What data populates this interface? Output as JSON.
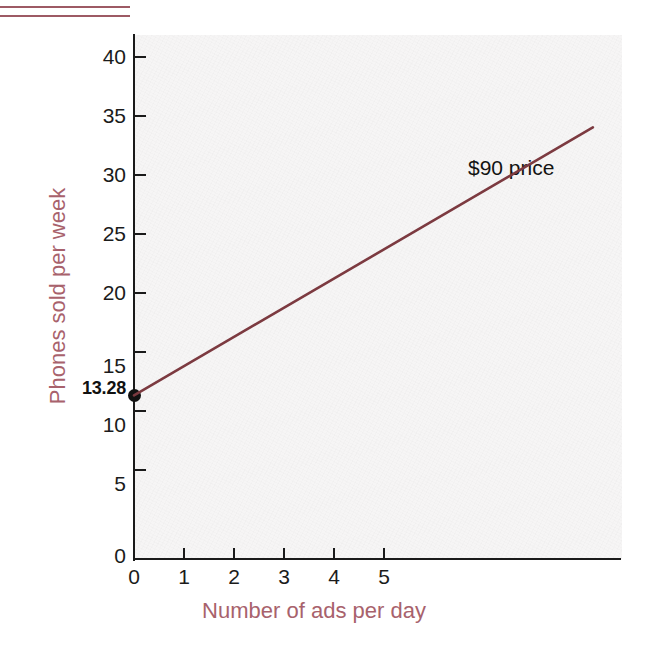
{
  "figure": {
    "background_color": "#ffffff",
    "plot_background_color": "#f6f5f5",
    "rule_color": "#9d5a64",
    "axis_title_color": "#a8626c",
    "line_color": "#7c3a40",
    "marker_color": "#121212"
  },
  "decor": {
    "top_rule_1": "",
    "top_rule_2": ""
  },
  "chart_data": {
    "type": "line",
    "title": "",
    "subtitle": "",
    "xlabel": "Number of ads per day",
    "ylabel": "Phones sold per week",
    "xlim": [
      0,
      6.7
    ],
    "ylim": [
      0,
      42.5
    ],
    "grid": false,
    "legend_position": "inline-annotation",
    "x_ticks": [
      0,
      1,
      2,
      3,
      4,
      5
    ],
    "x_tick_labels": [
      "0",
      "1",
      "2",
      "3",
      "4",
      "5"
    ],
    "y_ticks": [
      0,
      5,
      10,
      15,
      20,
      25,
      30,
      35,
      40
    ],
    "y_tick_labels": [
      "0",
      "5",
      "10",
      "15",
      "20",
      "25",
      "30",
      "35",
      "40"
    ],
    "series": [
      {
        "name": "$90 price",
        "annotation": "$90 price",
        "color": "#7c3a40",
        "x": [
          0,
          6.3
        ],
        "y": [
          13.28,
          35
        ],
        "intercept": 13.28,
        "slope": 3.448,
        "endpoints": [
          {
            "x": 0,
            "y": 13.28,
            "marker": true
          },
          {
            "x": 6.3,
            "y": 35,
            "marker": false
          }
        ]
      }
    ],
    "annotations": [
      {
        "text": "13.28",
        "type": "y-intercept-label",
        "x": 0,
        "y": 13.28
      },
      {
        "text": "$90 price",
        "type": "series-label",
        "x": 5.1,
        "y": 30.7
      }
    ]
  },
  "axis": {
    "y_labels": [
      "40",
      "35",
      "30",
      "25",
      "20",
      "15",
      "10",
      "5",
      "0"
    ],
    "x_labels": [
      "0",
      "1",
      "2",
      "3",
      "4",
      "5"
    ],
    "x_title": "Number of ads per day",
    "y_title": "Phones sold per week",
    "intercept_label": "13.28"
  },
  "annotation": {
    "series_label": "$90 price"
  }
}
